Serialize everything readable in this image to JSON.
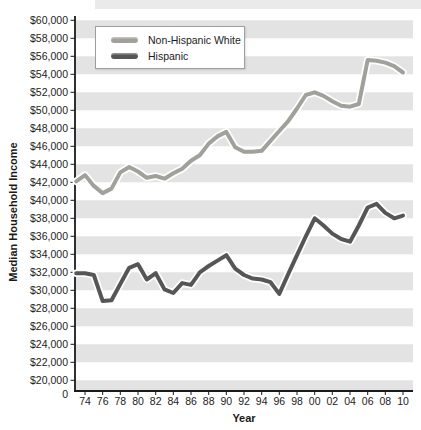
{
  "chart_data": {
    "type": "line",
    "title": "",
    "xlabel": "Year",
    "ylabel": "Median Household Income",
    "legend_position": "top-left",
    "grid_style": "alternating horizontal bands",
    "band_color": "#e3e3e3",
    "axis_color": "#1a1a1a",
    "text_color": "#222222",
    "halo_color": "#ffffff",
    "ylim": [
      20000,
      60000
    ],
    "y_axis_break_to_zero": true,
    "origin_label": "0",
    "y_tick_values": [
      60000,
      58000,
      56000,
      54000,
      52000,
      50000,
      48000,
      46000,
      44000,
      42000,
      40000,
      38000,
      36000,
      34000,
      32000,
      30000,
      28000,
      26000,
      24000,
      22000,
      20000
    ],
    "y_tick_labels": [
      "$60,000",
      "$58,000",
      "$56,000",
      "$54,000",
      "$52,000",
      "$50,000",
      "$48,000",
      "$46,000",
      "$44,000",
      "$42,000",
      "$40,000",
      "$38,000",
      "$36,000",
      "$34,000",
      "$32,000",
      "$30,000",
      "$28,000",
      "$26,000",
      "$24,000",
      "$22,000",
      "$20,000"
    ],
    "x_tick_values": [
      1974,
      1976,
      1978,
      1980,
      1982,
      1984,
      1986,
      1988,
      1990,
      1992,
      1994,
      1996,
      1998,
      2000,
      2002,
      2004,
      2006,
      2008,
      2010
    ],
    "x_tick_labels": [
      "74",
      "76",
      "78",
      "80",
      "82",
      "84",
      "86",
      "88",
      "90",
      "92",
      "94",
      "96",
      "98",
      "00",
      "02",
      "04",
      "06",
      "08",
      "10"
    ],
    "x": [
      1973,
      1974,
      1975,
      1976,
      1977,
      1978,
      1979,
      1980,
      1981,
      1982,
      1983,
      1984,
      1985,
      1986,
      1987,
      1988,
      1989,
      1990,
      1991,
      1992,
      1993,
      1994,
      1995,
      1996,
      1997,
      1998,
      1999,
      2000,
      2001,
      2002,
      2003,
      2004,
      2005,
      2006,
      2007,
      2008,
      2009,
      2010
    ],
    "series": [
      {
        "name": "Non-Hispanic White",
        "color": "#a2a09b",
        "values": [
          42100,
          42800,
          41600,
          40800,
          41300,
          43100,
          43700,
          43200,
          42500,
          42700,
          42400,
          43000,
          43500,
          44400,
          45000,
          46300,
          47100,
          47600,
          45900,
          45400,
          45400,
          45500,
          46600,
          47700,
          48800,
          50200,
          51700,
          52000,
          51600,
          51000,
          50500,
          50400,
          50700,
          55600,
          55500,
          55300,
          54900,
          54200
        ]
      },
      {
        "name": "Hispanic",
        "color": "#565656",
        "values": [
          31900,
          31900,
          31700,
          28800,
          28900,
          30700,
          32500,
          32900,
          31200,
          31900,
          30100,
          29700,
          30800,
          30600,
          32000,
          32700,
          33300,
          33900,
          32400,
          31700,
          31300,
          31200,
          30900,
          29600,
          31800,
          33900,
          36000,
          38000,
          37200,
          36300,
          35700,
          35400,
          37200,
          39200,
          39600,
          38600,
          38000,
          38300
        ]
      }
    ]
  }
}
